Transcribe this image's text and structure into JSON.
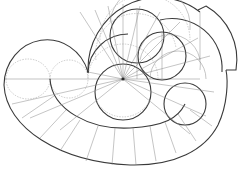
{
  "diagram": {
    "title": "",
    "colors": {
      "bold_stroke": "#3a3a3a",
      "thin_stroke": "#8a8a8a",
      "background": "#ffffff"
    }
  }
}
